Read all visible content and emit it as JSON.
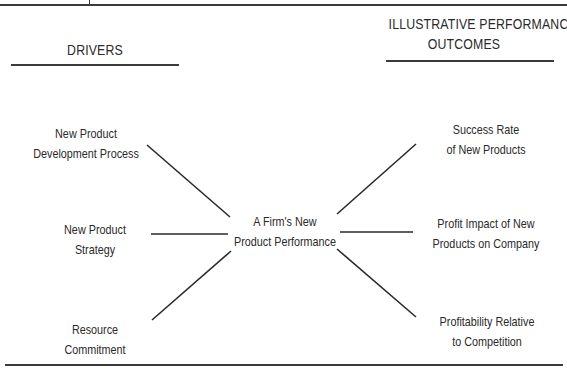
{
  "headers": {
    "drivers": "DRIVERS",
    "outcomes_line1": "ILLUSTRATIVE PERFORMANCE",
    "outcomes_line2": "OUTCOMES"
  },
  "center": {
    "line1": "A Firm's New",
    "line2": "Product Performance"
  },
  "drivers": [
    {
      "line1": "New Product",
      "line2": "Development Process"
    },
    {
      "line1": "New Product",
      "line2": "Strategy"
    },
    {
      "line1": "Resource",
      "line2": "Commitment"
    }
  ],
  "outcomes": [
    {
      "line1": "Success Rate",
      "line2": "of New Products"
    },
    {
      "line1": "Profit Impact of New",
      "line2": "Products on Company"
    },
    {
      "line1": "Profitability Relative",
      "line2": "to Competition"
    }
  ],
  "colors": {
    "ink": "#2a2a2a",
    "rule": "#3a3a3a",
    "background": "#ffffff"
  }
}
